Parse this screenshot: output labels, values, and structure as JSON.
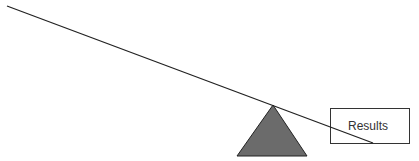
{
  "diagram": {
    "type": "seesaw",
    "box": {
      "label": "Results"
    },
    "colors": {
      "line": "#222222",
      "fulcrum_fill": "#6b6b6b",
      "fulcrum_stroke": "#222222",
      "box_stroke": "#333333",
      "background": "#ffffff"
    }
  }
}
